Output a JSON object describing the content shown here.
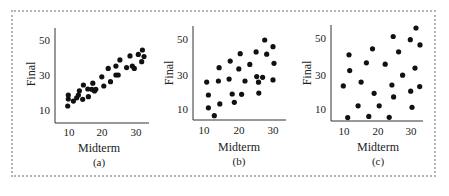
{
  "figure": {
    "x_label": "Midterm",
    "y_label": "Final",
    "x_ticks": [
      10,
      20,
      30
    ],
    "y_ticks": [
      10,
      30,
      50
    ]
  },
  "chart_data": [
    {
      "type": "scatter",
      "panel_label": "(a)",
      "xlabel": "Midterm",
      "ylabel": "Final",
      "xlim": [
        6,
        33
      ],
      "ylim": [
        3,
        57
      ],
      "x_ticks": [
        10,
        20,
        30
      ],
      "y_ticks": [
        10,
        30,
        50
      ],
      "grid": false,
      "points": [
        [
          9.6,
          12.3
        ],
        [
          9.8,
          18.6
        ],
        [
          9.8,
          16.3
        ],
        [
          11.3,
          15.1
        ],
        [
          12.3,
          17.0
        ],
        [
          12.8,
          18.6
        ],
        [
          13.1,
          21.0
        ],
        [
          14.3,
          24.3
        ],
        [
          14.1,
          16.1
        ],
        [
          15.6,
          22.0
        ],
        [
          15.8,
          17.6
        ],
        [
          17.1,
          25.3
        ],
        [
          16.8,
          21.8
        ],
        [
          17.6,
          20.9
        ],
        [
          18.0,
          21.8
        ],
        [
          19.8,
          29.0
        ],
        [
          20.4,
          23.7
        ],
        [
          21.7,
          33.8
        ],
        [
          22.4,
          26.2
        ],
        [
          24.0,
          35.1
        ],
        [
          24.0,
          30.0
        ],
        [
          24.7,
          30.0
        ],
        [
          25.2,
          38.6
        ],
        [
          27.2,
          34.2
        ],
        [
          28.2,
          40.9
        ],
        [
          28.9,
          35.1
        ],
        [
          29.5,
          33.8
        ],
        [
          30.7,
          41.8
        ],
        [
          31.9,
          44.3
        ],
        [
          32.4,
          40.5
        ],
        [
          31.7,
          37.6
        ]
      ]
    },
    {
      "type": "scatter",
      "panel_label": "(b)",
      "xlabel": "Midterm",
      "ylabel": "Final",
      "xlim": [
        6,
        33
      ],
      "ylim": [
        3,
        57
      ],
      "x_ticks": [
        10,
        20,
        30
      ],
      "y_ticks": [
        10,
        30,
        50
      ],
      "grid": false,
      "points": [
        [
          10.7,
          25.4
        ],
        [
          11.2,
          18.0
        ],
        [
          11.2,
          10.7
        ],
        [
          12.9,
          6.2
        ],
        [
          14.1,
          26.0
        ],
        [
          14.3,
          33.6
        ],
        [
          14.5,
          12.9
        ],
        [
          17.2,
          27.1
        ],
        [
          17.5,
          37.4
        ],
        [
          18.1,
          18.6
        ],
        [
          18.7,
          13.8
        ],
        [
          20.0,
          32.9
        ],
        [
          20.4,
          41.6
        ],
        [
          20.8,
          18.4
        ],
        [
          21.8,
          26.0
        ],
        [
          23.2,
          35.5
        ],
        [
          25.0,
          42.6
        ],
        [
          25.2,
          28.5
        ],
        [
          25.7,
          25.3
        ],
        [
          25.8,
          19.1
        ],
        [
          26.9,
          28.1
        ],
        [
          27.5,
          49.4
        ],
        [
          28.1,
          41.3
        ],
        [
          29.9,
          26.6
        ],
        [
          29.9,
          45.6
        ],
        [
          30.2,
          36.1
        ]
      ]
    },
    {
      "type": "scatter",
      "panel_label": "(c)",
      "xlabel": "Midterm",
      "ylabel": "Final",
      "xlim": [
        6,
        33
      ],
      "ylim": [
        3,
        57
      ],
      "x_ticks": [
        10,
        20,
        30
      ],
      "y_ticks": [
        10,
        30,
        50
      ],
      "grid": false,
      "points": [
        [
          9.8,
          23.2
        ],
        [
          11.1,
          5.3
        ],
        [
          11.5,
          40.7
        ],
        [
          11.7,
          31.8
        ],
        [
          14.2,
          12.0
        ],
        [
          15.1,
          25.3
        ],
        [
          16.7,
          36.2
        ],
        [
          17.4,
          6.0
        ],
        [
          18.5,
          44.1
        ],
        [
          19.0,
          19.0
        ],
        [
          20.5,
          12.0
        ],
        [
          22.3,
          35.4
        ],
        [
          23.5,
          5.5
        ],
        [
          24.3,
          23.7
        ],
        [
          24.7,
          51.0
        ],
        [
          24.8,
          17.0
        ],
        [
          26.3,
          42.4
        ],
        [
          27.5,
          29.2
        ],
        [
          29.8,
          49.2
        ],
        [
          29.9,
          20.2
        ],
        [
          30.3,
          11.1
        ],
        [
          31.2,
          33.2
        ],
        [
          31.5,
          55.8
        ],
        [
          32.7,
          46.3
        ],
        [
          32.6,
          22.8
        ]
      ]
    }
  ]
}
